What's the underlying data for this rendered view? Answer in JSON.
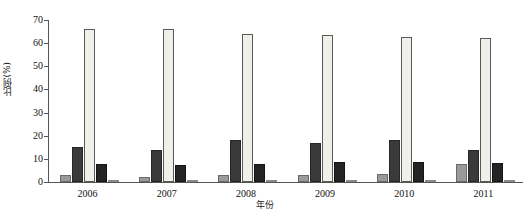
{
  "chart_data": {
    "type": "bar",
    "title": "",
    "xlabel": "年份",
    "ylabel": "比例(%)",
    "ylim": [
      0,
      70
    ],
    "ytick_step": 10,
    "yticks": [
      0,
      10,
      20,
      30,
      40,
      50,
      60,
      70
    ],
    "ytick_labels": [
      "0",
      "10",
      "20",
      "30",
      "40",
      "50",
      "60",
      "70"
    ],
    "grid": false,
    "legend": "none",
    "categories": [
      "2006",
      "2007",
      "2008",
      "2009",
      "2010",
      "2011"
    ],
    "series": [
      {
        "name": "series-1",
        "color": "#9a9a9a",
        "values": [
          3.0,
          2.2,
          3.2,
          3.0,
          3.6,
          7.8
        ]
      },
      {
        "name": "series-2",
        "color": "#3a3a3a",
        "values": [
          15.3,
          14.0,
          18.0,
          17.0,
          18.2,
          13.8
        ]
      },
      {
        "name": "series-3",
        "color": "#f0f0ea",
        "values": [
          66.3,
          66.0,
          63.8,
          63.6,
          62.8,
          62.3
        ]
      },
      {
        "name": "series-4",
        "color": "#242424",
        "values": [
          7.8,
          7.2,
          8.0,
          8.5,
          8.5,
          8.4
        ]
      },
      {
        "name": "series-5",
        "color": "#b5b5b5",
        "values": [
          1.0,
          0.6,
          0.7,
          0.6,
          0.6,
          0.6
        ]
      }
    ]
  }
}
